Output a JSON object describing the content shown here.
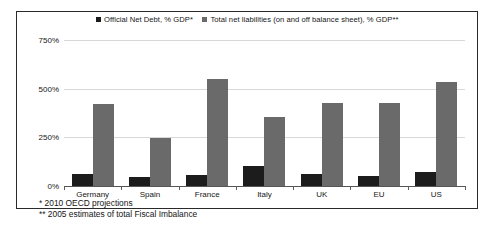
{
  "chart_data": {
    "type": "bar",
    "title": "",
    "xlabel": "",
    "ylabel": "",
    "categories": [
      "Germany",
      "Spain",
      "France",
      "Italy",
      "UK",
      "EU",
      "US"
    ],
    "series": [
      {
        "name": "Official Net Debt, % GDP*",
        "color": "#1c1c1c",
        "values": [
          60,
          45,
          55,
          105,
          60,
          50,
          70
        ]
      },
      {
        "name": "Total net liabilities (on and off balance sheet), % GDP**",
        "color": "#6a6a6a",
        "values": [
          420,
          245,
          550,
          355,
          425,
          425,
          535
        ]
      }
    ],
    "ylim": [
      0,
      750
    ],
    "yticks": [
      0,
      250,
      500,
      750
    ],
    "ytick_labels": [
      "0%",
      "250%",
      "500%",
      "750%"
    ],
    "grid": true,
    "legend_position": "top-center"
  },
  "footnotes": [
    "* 2010 OECD projections",
    "** 2005 estimates of total Fiscal Imbalance"
  ]
}
